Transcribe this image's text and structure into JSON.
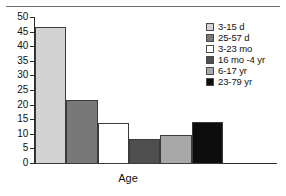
{
  "chart_data": {
    "type": "bar",
    "title": "",
    "xlabel": "Age",
    "ylabel": "",
    "ylim": [
      0,
      50
    ],
    "yticks": [
      0,
      5,
      10,
      15,
      20,
      25,
      30,
      35,
      40,
      45,
      50
    ],
    "grid": false,
    "legend_position": "right",
    "categories": [
      "3-15 d",
      "25-57 d",
      "3-23 mo",
      "16 mo -4 yr",
      "6-17 yr",
      "23-79 yr"
    ],
    "values": [
      47,
      22,
      14,
      8.5,
      10,
      14.5
    ],
    "colors": [
      "#d3d3d3",
      "#787878",
      "#ffffff",
      "#4f4f4f",
      "#a8a8a8",
      "#0d0d0d"
    ],
    "series": [
      {
        "name": "Age",
        "values": [
          47,
          22,
          14,
          8.5,
          10,
          14.5
        ]
      }
    ]
  },
  "axis": {
    "y_tick_labels": [
      "50",
      "45",
      "40",
      "35",
      "30",
      "25",
      "20",
      "15",
      "10",
      "5",
      "0"
    ],
    "x_axis_title": "Age"
  },
  "legend": {
    "items": [
      {
        "label": "3-15 d",
        "color": "#d3d3d3"
      },
      {
        "label": "25-57 d",
        "color": "#787878"
      },
      {
        "label": "3-23 mo",
        "color": "#ffffff"
      },
      {
        "label": "16 mo -4 yr",
        "color": "#4f4f4f"
      },
      {
        "label": "6-17 yr",
        "color": "#a8a8a8"
      },
      {
        "label": "23-79 yr",
        "color": "#0d0d0d"
      }
    ]
  }
}
